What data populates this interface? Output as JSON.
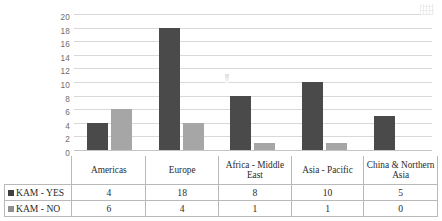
{
  "chart_data": {
    "type": "bar",
    "title": "",
    "xlabel": "",
    "ylabel": "",
    "ylim": [
      0,
      20
    ],
    "ytick_step": 2,
    "yticks": [
      "20",
      "18",
      "16",
      "14",
      "12",
      "10",
      "8",
      "6",
      "4",
      "2",
      "0"
    ],
    "grid": true,
    "legend_position": "table-left",
    "categories": [
      "Americas",
      "Europe",
      "Africa - Middle East",
      "Asia - Pacific",
      "China & Northern Asia"
    ],
    "series": [
      {
        "name": "KAM - YES",
        "color": "#4a4a4a",
        "values": [
          4,
          18,
          8,
          10,
          5
        ]
      },
      {
        "name": "KAM - NO",
        "color": "#a6a6a6",
        "values": [
          6,
          4,
          1,
          1,
          0
        ]
      }
    ]
  },
  "table": {
    "header_blank": "",
    "series_labels": [
      "KAM - YES",
      "KAM - NO"
    ]
  }
}
